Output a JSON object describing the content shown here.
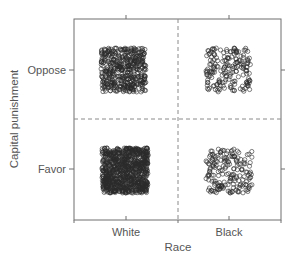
{
  "chart_data": {
    "type": "scatter",
    "subtype": "jittered categorical scatter (cross-tabulation)",
    "title": "",
    "xlabel": "Race",
    "ylabel": "Capital punishment",
    "x_categories": [
      "White",
      "Black"
    ],
    "y_categories": [
      "Favor",
      "Oppose"
    ],
    "grid": false,
    "dividers": "dashed lines separating categories",
    "legend": null,
    "marker": "open circle",
    "cells": [
      {
        "x": "White",
        "y": "Oppose",
        "relative_density": "high"
      },
      {
        "x": "Black",
        "y": "Oppose",
        "relative_density": "low"
      },
      {
        "x": "White",
        "y": "Favor",
        "relative_density": "very high"
      },
      {
        "x": "Black",
        "y": "Favor",
        "relative_density": "low"
      }
    ]
  },
  "axes": {
    "x_title": "Race",
    "y_title": "Capital punishment",
    "x_ticks": [
      "White",
      "Black"
    ],
    "y_ticks": [
      "Oppose",
      "Favor"
    ]
  },
  "colors": {
    "frame": "#6f6f6f",
    "divider": "#8a8a8a",
    "marker": "#2a2a2a",
    "text": "#555555"
  }
}
